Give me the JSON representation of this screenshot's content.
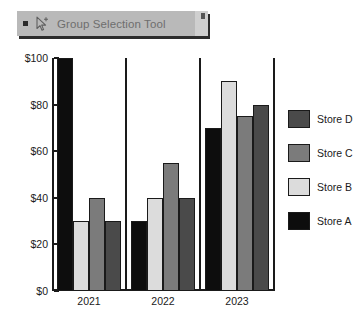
{
  "tooltip": {
    "label": "Group Selection Tool",
    "bullet_icon": "square-bullet-icon",
    "cursor_icon": "group-selection-cursor-icon",
    "background": "#b9b9b9",
    "text_color": "#6e6e6e"
  },
  "chart_data": {
    "type": "bar",
    "title": "",
    "xlabel": "",
    "ylabel": "",
    "categories": [
      "2021",
      "2022",
      "2023"
    ],
    "series": [
      {
        "name": "Store A",
        "color": "#0d0d0d",
        "values": [
          100,
          30,
          70
        ]
      },
      {
        "name": "Store B",
        "color": "#dcdcdc",
        "values": [
          30,
          40,
          90
        ]
      },
      {
        "name": "Store C",
        "color": "#7b7b7b",
        "values": [
          40,
          55,
          75
        ]
      },
      {
        "name": "Store D",
        "color": "#4a4a4a",
        "values": [
          30,
          40,
          80
        ]
      }
    ],
    "ylim": [
      0,
      100
    ],
    "yticks": [
      0,
      20,
      40,
      60,
      80,
      100
    ],
    "ytick_labels": [
      "$0",
      "$20",
      "$40",
      "$60",
      "$80",
      "$100"
    ],
    "grid": false,
    "legend_position": "right",
    "legend_order": [
      "Store D",
      "Store C",
      "Store B",
      "Store A"
    ],
    "group_dividers": true,
    "axis_color": "#1a1a1a"
  }
}
